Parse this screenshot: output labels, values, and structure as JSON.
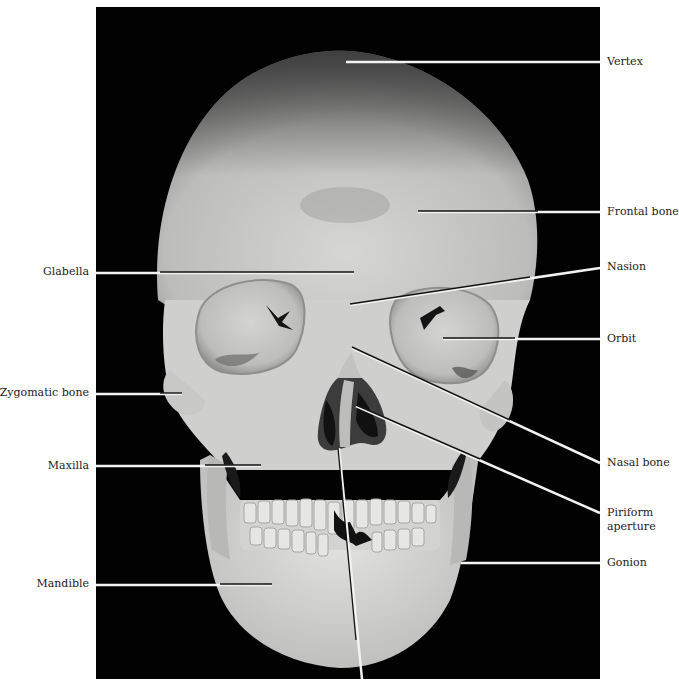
{
  "figure": {
    "background_color": "#020202",
    "bone_color": "#d8d8d6",
    "leader_line_color_on_bone": "#111111",
    "leader_line_color_on_background": "#f2f2f2"
  },
  "labels": {
    "right": [
      {
        "id": "vertex",
        "text": "Vertex",
        "y": 62,
        "target": [
          346,
          62
        ]
      },
      {
        "id": "frontal-bone",
        "text": "Frontal bone",
        "y": 212,
        "target": [
          418,
          211
        ]
      },
      {
        "id": "nasion",
        "text": "Nasion",
        "y": 267,
        "target": [
          350,
          305
        ]
      },
      {
        "id": "orbit",
        "text": "Orbit",
        "y": 339,
        "target": [
          443,
          338
        ]
      },
      {
        "id": "nasal-bone",
        "text": "Nasal bone",
        "y": 463,
        "target": [
          352,
          348
        ]
      },
      {
        "id": "piriform-aperture",
        "text": "Piriform",
        "text2": "aperture",
        "y": 513,
        "target": [
          356,
          406
        ]
      },
      {
        "id": "gonion",
        "text": "Gonion",
        "y": 563,
        "target": [
          461,
          563
        ]
      }
    ],
    "left": [
      {
        "id": "glabella",
        "text": "Glabella",
        "y": 272,
        "target": [
          354,
          272
        ]
      },
      {
        "id": "zygomatic-bone",
        "text": "Zygomatic bone",
        "y": 393,
        "target": [
          182,
          393
        ]
      },
      {
        "id": "maxilla",
        "text": "Maxilla",
        "y": 466,
        "target": [
          261,
          466
        ]
      },
      {
        "id": "mandible",
        "text": "Mandible",
        "y": 584,
        "target": [
          272,
          584
        ]
      }
    ],
    "bottom_leader": {
      "id": "unlabeled-bottom",
      "from": [
        339,
        448
      ],
      "to": [
        362,
        679
      ]
    }
  }
}
